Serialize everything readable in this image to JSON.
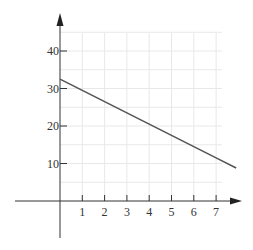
{
  "chart_data": {
    "type": "line",
    "title": "",
    "xlabel": "",
    "ylabel": "",
    "xlim": [
      -0.8,
      7.9
    ],
    "ylim": [
      -15,
      45
    ],
    "x_ticks": [
      1,
      2,
      3,
      4,
      5,
      6,
      7
    ],
    "y_ticks": [
      10,
      20,
      30,
      40
    ],
    "x_tick_labels": [
      "1",
      "2",
      "3",
      "4",
      "5",
      "6",
      "7"
    ],
    "y_tick_labels": [
      "10",
      "20",
      "30",
      "40"
    ],
    "grid": true,
    "minor_grid_y_step": 5,
    "series": [
      {
        "name": "line",
        "x": [
          0,
          1,
          2,
          3,
          4,
          5,
          6,
          7,
          7.9
        ],
        "values": [
          32.5,
          29.5,
          26.5,
          23.5,
          20.5,
          17.5,
          14.5,
          11.5,
          8.8
        ],
        "color": "#555555"
      }
    ],
    "legend": null
  },
  "colors": {
    "axis": "#333333",
    "grid": "#e8e8e8",
    "line": "#555555"
  }
}
